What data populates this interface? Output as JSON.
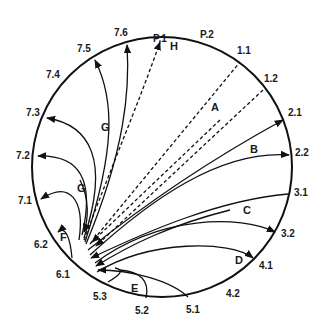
{
  "diagram": {
    "title": "",
    "boundary_labels": [
      {
        "id": "P.1",
        "text": "P.1",
        "x": 153,
        "y": 42
      },
      {
        "id": "P.2",
        "text": "P.2",
        "x": 200,
        "y": 38
      },
      {
        "id": "1.1",
        "text": "1.1",
        "x": 237,
        "y": 54
      },
      {
        "id": "1.2",
        "text": "1.2",
        "x": 264,
        "y": 82
      },
      {
        "id": "2.1",
        "text": "2.1",
        "x": 288,
        "y": 116
      },
      {
        "id": "2.2",
        "text": "2.2",
        "x": 295,
        "y": 156
      },
      {
        "id": "3.1",
        "text": "3.1",
        "x": 294,
        "y": 196
      },
      {
        "id": "3.2",
        "text": "3.2",
        "x": 281,
        "y": 237
      },
      {
        "id": "4.1",
        "text": "4.1",
        "x": 259,
        "y": 269
      },
      {
        "id": "4.2",
        "text": "4.2",
        "x": 226,
        "y": 297
      },
      {
        "id": "5.1",
        "text": "5.1",
        "x": 186,
        "y": 313
      },
      {
        "id": "5.2",
        "text": "5.2",
        "x": 135,
        "y": 314
      },
      {
        "id": "5.3",
        "text": "5.3",
        "x": 93,
        "y": 300
      },
      {
        "id": "6.1",
        "text": "6.1",
        "x": 56,
        "y": 278
      },
      {
        "id": "6.2",
        "text": "6.2",
        "x": 34,
        "y": 248
      },
      {
        "id": "7.1",
        "text": "7.1",
        "x": 18,
        "y": 204
      },
      {
        "id": "7.2",
        "text": "7.2",
        "x": 16,
        "y": 159
      },
      {
        "id": "7.3",
        "text": "7.3",
        "x": 26,
        "y": 116
      },
      {
        "id": "7.4",
        "text": "7.4",
        "x": 46,
        "y": 78
      },
      {
        "id": "7.5",
        "text": "7.5",
        "x": 77,
        "y": 52
      },
      {
        "id": "7.6",
        "text": "7.6",
        "x": 114,
        "y": 36
      }
    ],
    "region_labels": [
      {
        "id": "A",
        "text": "A",
        "x": 211,
        "y": 111
      },
      {
        "id": "B",
        "text": "B",
        "x": 250,
        "y": 153
      },
      {
        "id": "C",
        "text": "C",
        "x": 243,
        "y": 214
      },
      {
        "id": "D",
        "text": "D",
        "x": 235,
        "y": 264
      },
      {
        "id": "E",
        "text": "E",
        "x": 131,
        "y": 292
      },
      {
        "id": "F",
        "text": "F",
        "x": 60,
        "y": 241
      },
      {
        "id": "G_upper",
        "text": "G",
        "x": 101,
        "y": 131
      },
      {
        "id": "G_lower",
        "text": "G",
        "x": 77,
        "y": 192
      },
      {
        "id": "H",
        "text": "H",
        "x": 170,
        "y": 50
      }
    ],
    "circle": {
      "cx": 162,
      "cy": 167,
      "r": 130
    }
  }
}
